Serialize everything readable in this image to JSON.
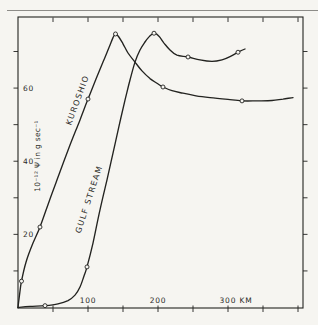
{
  "figure": {
    "background": "#f6f5f1",
    "ink": "#232320",
    "text_color": "#2b2b28",
    "scan_edge_color": "#8d8c88"
  },
  "chart_data": {
    "type": "line",
    "title": "",
    "xlabel": "KM",
    "ylabel": "10⁻¹² Ψ in g sec⁻¹",
    "xlim": [
      0,
      407
    ],
    "ylim": [
      0,
      79.4
    ],
    "grid": false,
    "x_axis": {
      "ticks": [
        50,
        100,
        150,
        200,
        250,
        300,
        350,
        400
      ],
      "labels": [
        {
          "value": 100,
          "text": "100"
        },
        {
          "value": 200,
          "text": "200"
        },
        {
          "value": 300,
          "text": "300 KM"
        }
      ]
    },
    "y_axis": {
      "ticks": [
        10,
        20,
        30,
        40,
        50,
        60,
        70
      ],
      "labels": [
        {
          "value": 20,
          "text": "20"
        },
        {
          "value": 40,
          "text": "40"
        },
        {
          "value": 60,
          "text": "60"
        }
      ],
      "title": "10⁻¹² Ψ in g sec⁻¹"
    },
    "series": [
      {
        "name": "KUROSHIO",
        "x": [
          0,
          2.1,
          5,
          11.4,
          21.4,
          31.4,
          45.7,
          60,
          74.3,
          88.6,
          100,
          111.4,
          121.4,
          130,
          135.7,
          139.3,
          143.6,
          150,
          157.1,
          167.1,
          177.1,
          188.6,
          198.6,
          207.1,
          220,
          235.7,
          254.3,
          274.3,
          300,
          320,
          342.9,
          362.9,
          378.6,
          392.9
        ],
        "y": [
          0,
          3.4,
          7.2,
          12.4,
          17.6,
          22.0,
          29.7,
          37.1,
          44.4,
          51.3,
          57.0,
          62.5,
          67.1,
          71.1,
          73.8,
          74.8,
          74.1,
          72.1,
          69.6,
          67.1,
          64.7,
          62.6,
          61.3,
          60.3,
          59.3,
          58.6,
          57.9,
          57.4,
          56.9,
          56.5,
          56.5,
          56.6,
          57.0,
          57.4
        ],
        "markers_x": [
          5,
          31.4,
          100,
          139.3,
          207.1,
          320
        ],
        "markers_y": [
          7.2,
          22.0,
          57.0,
          74.8,
          60.3,
          56.5
        ],
        "label": {
          "text": "KUROSHIO",
          "x": 88.6,
          "y": 56.5,
          "angle": -70
        }
      },
      {
        "name": "GULF STREAM",
        "x": [
          0,
          17.1,
          38.6,
          57.1,
          71.4,
          81.4,
          88.6,
          94.3,
          98.6,
          107.1,
          117.1,
          127.1,
          135.7,
          144.3,
          152.9,
          160,
          167.1,
          174.3,
          181.4,
          187.1,
          191.4,
          195,
          201.4,
          208.6,
          217.1,
          227.1,
          242.9,
          260,
          277.1,
          291.4,
          302.9,
          314.3,
          324.3
        ],
        "y": [
          0,
          0.3,
          0.5,
          1.0,
          1.9,
          3.4,
          5.6,
          8.6,
          11.1,
          17.6,
          26.7,
          34.9,
          42.2,
          49.6,
          56.7,
          62.2,
          67.1,
          70.4,
          72.6,
          74.0,
          74.7,
          75.0,
          74.2,
          72.3,
          70.4,
          69.0,
          68.5,
          67.7,
          67.3,
          67.7,
          68.6,
          69.8,
          70.7
        ],
        "markers_x": [
          38.6,
          98.6,
          194.3,
          242.9,
          314.3
        ],
        "markers_y": [
          0.5,
          11.1,
          75.0,
          68.5,
          69.8
        ],
        "label": {
          "text": "GULF STREAM",
          "x": 105,
          "y": 29.4,
          "angle": -72
        }
      }
    ]
  }
}
